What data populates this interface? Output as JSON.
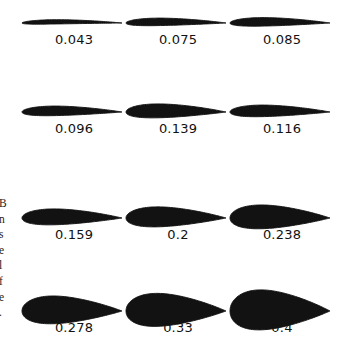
{
  "figure": {
    "background_color": "#ffffff",
    "ink_color": "#121212",
    "type": "airfoil-thickness-gallery",
    "columns": 3,
    "rows": 4
  },
  "margin_text": {
    "lines": [
      "B",
      "n",
      "s",
      "e",
      "l",
      "f",
      "e",
      "."
    ]
  },
  "chart_data": {
    "type": "table",
    "title": "",
    "xlabel": "",
    "ylabel": "",
    "categories": [
      "0.043",
      "0.075",
      "0.085",
      "0.096",
      "0.139",
      "0.116",
      "0.159",
      "0.2",
      "0.238",
      "0.278",
      "0.33",
      "0.4"
    ],
    "values": [
      0.043,
      0.075,
      0.085,
      0.096,
      0.139,
      0.116,
      0.159,
      0.2,
      0.238,
      0.278,
      0.33,
      0.4
    ],
    "grid": false,
    "legend": "none"
  },
  "airfoils": [
    {
      "label": "0.043",
      "thickness": 0.043,
      "row": 0,
      "col": 0
    },
    {
      "label": "0.075",
      "thickness": 0.075,
      "row": 0,
      "col": 1
    },
    {
      "label": "0.085",
      "thickness": 0.085,
      "row": 0,
      "col": 2
    },
    {
      "label": "0.096",
      "thickness": 0.096,
      "row": 1,
      "col": 0
    },
    {
      "label": "0.139",
      "thickness": 0.139,
      "row": 1,
      "col": 1
    },
    {
      "label": "0.116",
      "thickness": 0.116,
      "row": 1,
      "col": 2
    },
    {
      "label": "0.159",
      "thickness": 0.159,
      "row": 2,
      "col": 0
    },
    {
      "label": "0.2",
      "thickness": 0.2,
      "row": 2,
      "col": 1
    },
    {
      "label": "0.238",
      "thickness": 0.238,
      "row": 2,
      "col": 2
    },
    {
      "label": "0.278",
      "thickness": 0.278,
      "row": 3,
      "col": 0
    },
    {
      "label": "0.33",
      "thickness": 0.33,
      "row": 3,
      "col": 1
    },
    {
      "label": "0.4",
      "thickness": 0.4,
      "row": 3,
      "col": 2
    }
  ]
}
